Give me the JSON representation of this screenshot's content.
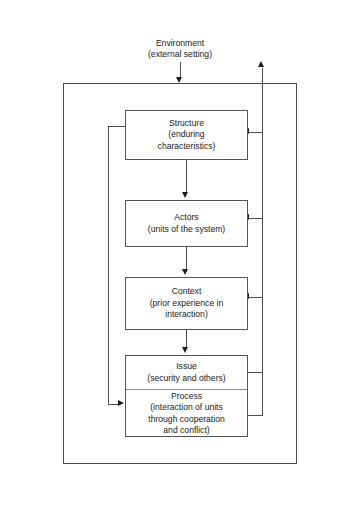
{
  "diagram": {
    "environment": {
      "title": "Environment",
      "subtitle": "(external setting)"
    },
    "nodes": [
      {
        "id": "structure",
        "title": "Structure",
        "subtitle": "(enduring characteristics)",
        "line1": "Structure",
        "line2": "(enduring",
        "line3": "characteristics)"
      },
      {
        "id": "actors",
        "title": "Actors",
        "subtitle": "(units of the system)",
        "line1": "Actors",
        "line2": "(units of the system)"
      },
      {
        "id": "context",
        "title": "Context",
        "subtitle": "(prior experience in interaction)",
        "line1": "Context",
        "line2": "(prior experience in",
        "line3": "interaction)"
      },
      {
        "id": "issue",
        "title": "Issue",
        "subtitle": "(security and others)",
        "line1": "Issue",
        "line2": "(security and others)"
      },
      {
        "id": "process",
        "title": "Process",
        "subtitle": "(interaction of units through cooperation and conflict)",
        "line1": "Process",
        "line2": "(interaction of units",
        "line3": "through cooperation",
        "line4": "and conflict)"
      }
    ],
    "colors": {
      "box_border": "#555555",
      "boundary_border": "#4a4a4a",
      "connector": "#4f4f4f",
      "arrow_fill": "#1c1c1c",
      "text": "#1a1a1a",
      "stipple": "#8d8d8d",
      "background": "#ffffff"
    }
  }
}
